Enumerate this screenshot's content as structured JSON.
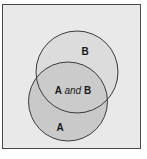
{
  "diagram": {
    "type": "venn",
    "colors": {
      "background": "#e9e9e9",
      "frame_border": "#4a4a4a",
      "circle_a_fill": "#c9c9c9",
      "circle_b_fill": "#dcdcdc",
      "overlap_fill": "#cbcbcb",
      "circle_stroke": "#3a3a3a"
    },
    "sets": [
      {
        "id": "A",
        "label": "A"
      },
      {
        "id": "B",
        "label": "B"
      }
    ],
    "intersection": {
      "left": "A",
      "connector": "and",
      "right": "B"
    }
  }
}
